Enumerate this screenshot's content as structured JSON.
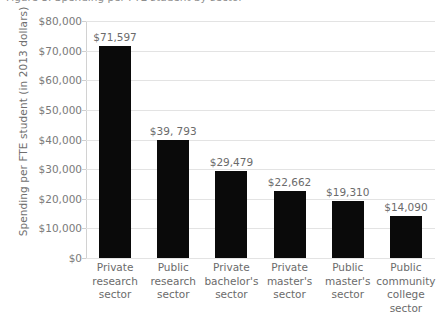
{
  "title_strip": {
    "text": "Figure 3. Spending per FTE student by sector"
  },
  "axes": {
    "y_title": "Spending per FTE student (in 2013 dollars)",
    "y_ticks": [
      "$80,000",
      "$70,000",
      "$60,000",
      "$50,000",
      "$40,000",
      "$30,000",
      "$20,000",
      "$10,000",
      "$0"
    ]
  },
  "colors": {
    "bar": "#0a0a0a",
    "gridline": "#e3e3e3",
    "label_text": "#6b6b6b",
    "tick_text": "#7a7a7a",
    "background": "#ffffff"
  },
  "chart_data": {
    "type": "bar",
    "title": "",
    "xlabel": "",
    "ylabel": "Spending per FTE student (in 2013 dollars)",
    "ylim": [
      0,
      80000
    ],
    "ytick_step": 10000,
    "grid": true,
    "legend": false,
    "categories": [
      "Private research sector",
      "Public research sector",
      "Private bachelor's sector",
      "Private master's sector",
      "Public master's sector",
      "Public community college sector"
    ],
    "category_lines": [
      [
        "Private",
        "research",
        "sector"
      ],
      [
        "Public",
        "research",
        "sector"
      ],
      [
        "Private",
        "bachelor's",
        "sector"
      ],
      [
        "Private",
        "master's",
        "sector"
      ],
      [
        "Public",
        "master's",
        "sector"
      ],
      [
        "Public",
        "community",
        "college sector"
      ]
    ],
    "values": [
      71597,
      39793,
      29479,
      22662,
      19310,
      14090
    ],
    "value_labels": [
      "$71,597",
      "$39, 793",
      "$29,479",
      "$22,662",
      "$19,310",
      "$14,090"
    ]
  }
}
